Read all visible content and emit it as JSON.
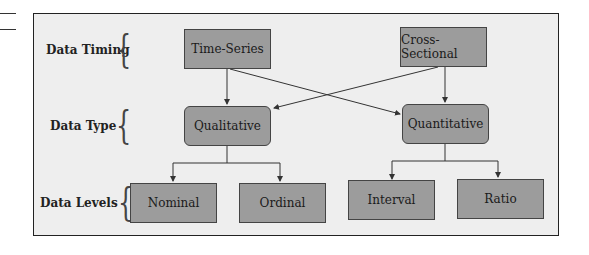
{
  "diagram": {
    "rows": [
      {
        "label": "Data Timing"
      },
      {
        "label": "Data Type"
      },
      {
        "label": "Data Levels"
      }
    ],
    "nodes": {
      "time_series": "Time-Series",
      "cross_sectional": "Cross-Sectional",
      "qualitative": "Qualitative",
      "quantitative": "Quantitative",
      "nominal": "Nominal",
      "ordinal": "Ordinal",
      "interval": "Interval",
      "ratio": "Ratio"
    },
    "edges": [
      [
        "Time-Series",
        "Qualitative"
      ],
      [
        "Time-Series",
        "Quantitative"
      ],
      [
        "Cross-Sectional",
        "Qualitative"
      ],
      [
        "Cross-Sectional",
        "Quantitative"
      ],
      [
        "Qualitative",
        "Nominal"
      ],
      [
        "Qualitative",
        "Ordinal"
      ],
      [
        "Quantitative",
        "Interval"
      ],
      [
        "Quantitative",
        "Ratio"
      ]
    ],
    "colors": {
      "node_fill": "#9c9c9c",
      "frame_fill": "#eeeeee",
      "line": "#333333"
    }
  }
}
